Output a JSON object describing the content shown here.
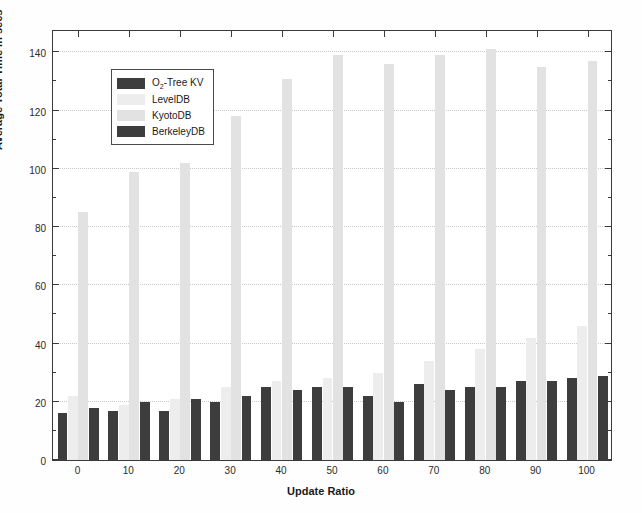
{
  "chart_data": {
    "type": "bar",
    "title": "",
    "xlabel": "Update Ratio",
    "ylabel": "Average Total Time in secs",
    "categories": [
      "0",
      "10",
      "20",
      "30",
      "40",
      "50",
      "60",
      "70",
      "80",
      "90",
      "100"
    ],
    "xtick_labels": [
      "0",
      "10",
      "20",
      "30",
      "40",
      "50",
      "60",
      "70",
      "80",
      "90",
      "100"
    ],
    "ytick_labels": [
      "0",
      "20",
      "40",
      "60",
      "80",
      "100",
      "120",
      "140"
    ],
    "ytick_values": [
      0,
      20,
      40,
      60,
      80,
      100,
      120,
      140
    ],
    "yminor_values": [
      10,
      30,
      50,
      70,
      90,
      110,
      130
    ],
    "ylim": [
      0,
      148
    ],
    "grid": true,
    "legend_position": "upper-left",
    "series": [
      {
        "name": "O_2-Tree KV",
        "color": "#3d3d3d",
        "values": [
          16,
          17,
          17,
          20,
          25,
          25,
          22,
          26,
          25,
          27,
          28
        ]
      },
      {
        "name": "LevelDB",
        "color": "#ededed",
        "values": [
          22,
          19,
          21,
          25,
          27,
          28,
          30,
          34,
          38,
          42,
          46
        ]
      },
      {
        "name": "KyotoDB",
        "color": "#e2e2e2",
        "values": [
          85,
          99,
          102,
          118,
          131,
          139,
          136,
          139,
          141,
          135,
          137
        ]
      },
      {
        "name": "BerkeleyDB",
        "color": "#3d3d3d",
        "values": [
          18,
          20,
          21,
          22,
          24,
          25,
          20,
          24,
          25,
          27,
          29
        ]
      }
    ]
  },
  "legend": {
    "items": [
      {
        "label_prefix": "O",
        "label_sub": "2",
        "label_suffix": "-Tree KV",
        "color": "#3d3d3d"
      },
      {
        "label_prefix": "LevelDB",
        "label_sub": "",
        "label_suffix": "",
        "color": "#ededed"
      },
      {
        "label_prefix": "KyotoDB",
        "label_sub": "",
        "label_suffix": "",
        "color": "#e2e2e2"
      },
      {
        "label_prefix": "BerkeleyDB",
        "label_sub": "",
        "label_suffix": "",
        "color": "#3d3d3d"
      }
    ]
  },
  "axes": {
    "x_title": "Update Ratio",
    "y_title": "Average Total Time in secs"
  },
  "colors": {
    "frame": "#3a3a3a",
    "grid": "#c8c8c8",
    "background": "#ffffff",
    "dark_series": "#3d3d3d",
    "light_series": "#ededed",
    "mid_light_series": "#e2e2e2"
  }
}
